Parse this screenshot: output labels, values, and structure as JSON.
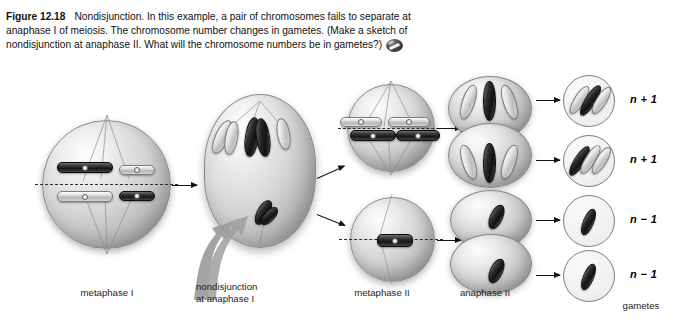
{
  "figure": {
    "label": "Figure 12.18",
    "caption_lines": [
      "Nondisjunction. In this example, a pair of chromosomes",
      "fails to separate at anaphase I of meiosis. The chromosome number",
      "changes in gametes. (Make a sketch of nondisjunction at anaphase II.",
      "What will the chromosome numbers be in gametes?)"
    ],
    "media_badge": "media-cell-icon"
  },
  "stages": [
    {
      "id": "metaphase-i",
      "label": "metaphase I"
    },
    {
      "id": "nondisjunction",
      "label": "nondisjunction\nat anaphase I"
    },
    {
      "id": "metaphase-ii",
      "label": "metaphase II"
    },
    {
      "id": "anaphase-ii",
      "label": "anaphase II"
    },
    {
      "id": "gametes",
      "label": "gametes"
    }
  ],
  "gametes": [
    {
      "id": "gamete-1",
      "ploidy": "n + 1",
      "chromosome_count": 3
    },
    {
      "id": "gamete-2",
      "ploidy": "n + 1",
      "chromosome_count": 3
    },
    {
      "id": "gamete-3",
      "ploidy": "n − 1",
      "chromosome_count": 1
    },
    {
      "id": "gamete-4",
      "ploidy": "n − 1",
      "chromosome_count": 1
    }
  ],
  "colors": {
    "background": "#ffffff",
    "text": "#1a1a1a",
    "chromosome_dark": "#171717",
    "chromosome_light": "#e2e2e2",
    "cell_fill": "#d2d2d2",
    "arrow": "#111111",
    "nondisjunction_arrow": "#9a9a9a"
  }
}
